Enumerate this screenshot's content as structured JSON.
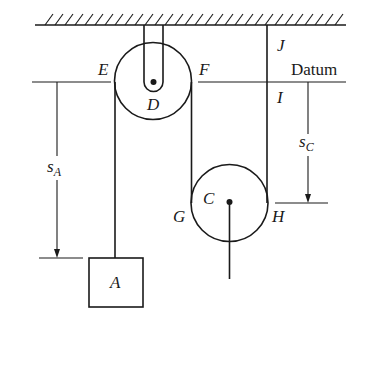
{
  "figure": {
    "datum_label": "Datum",
    "points": {
      "E": "E",
      "F": "F",
      "D": "D",
      "J": "J",
      "I": "I",
      "G": "G",
      "H": "H",
      "C": "C",
      "A": "A"
    },
    "dimensions": {
      "sA": {
        "main": "s",
        "subscript": "A"
      },
      "sC": {
        "main": "s",
        "subscript": "C"
      }
    },
    "colors": {
      "ink": "#1a1a1a",
      "background": "#ffffff"
    }
  }
}
